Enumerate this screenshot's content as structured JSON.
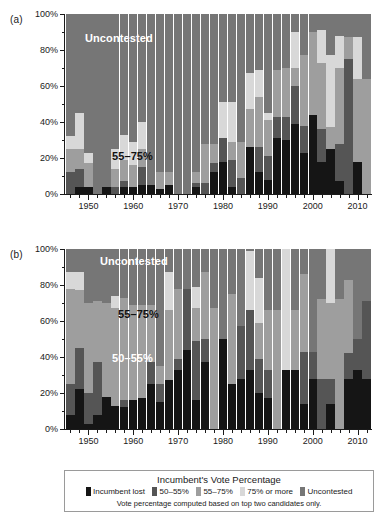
{
  "figure": {
    "panels": [
      {
        "id": "a",
        "label": "(a)"
      },
      {
        "id": "b",
        "label": "(b)"
      }
    ]
  },
  "legend": {
    "title": "Incumbent's Vote Percentage",
    "note": "Vote percentage computed based on top two candidates only.",
    "items": [
      {
        "label": "Incumbent lost",
        "color": "#151515"
      },
      {
        "label": "50–55%",
        "color": "#555555"
      },
      {
        "label": "55–75%",
        "color": "#9e9e9e"
      },
      {
        "label": "75% or more",
        "color": "#d8d8d8"
      },
      {
        "label": "Uncontested",
        "color": "#767676"
      }
    ]
  },
  "annotations": {
    "a": [
      {
        "text": "Uncontested",
        "style": "light",
        "left": 85,
        "top": 32
      },
      {
        "text": "55–75%",
        "style": "dark",
        "left": 112,
        "top": 150
      }
    ],
    "b": [
      {
        "text": "Uncontested",
        "style": "light",
        "left": 100,
        "top": 255
      },
      {
        "text": "55–75%",
        "style": "dark",
        "left": 118,
        "top": 308
      },
      {
        "text": "50–55%",
        "style": "light",
        "left": 112,
        "top": 352
      }
    ]
  },
  "chart_data": [
    {
      "type": "bar",
      "id": "a",
      "title": "",
      "xlabel": "",
      "ylabel": "",
      "ylim": [
        0,
        100
      ],
      "yticks": [
        "0%",
        "20%",
        "40%",
        "60%",
        "80%",
        "100%"
      ],
      "ytick_values": [
        0,
        20,
        40,
        60,
        80,
        100
      ],
      "xticks": [
        "1950",
        "1960",
        "1970",
        "1980",
        "1990",
        "2000",
        "2010"
      ],
      "xtick_values": [
        1950,
        1960,
        1970,
        1980,
        1990,
        2000,
        2010
      ],
      "grid": false,
      "legend_position": "bottom",
      "stacked": true,
      "categories": [
        1946,
        1948,
        1950,
        1952,
        1954,
        1956,
        1958,
        1960,
        1962,
        1964,
        1966,
        1968,
        1970,
        1972,
        1974,
        1976,
        1978,
        1980,
        1982,
        1984,
        1986,
        1988,
        1990,
        1992,
        1994,
        1996,
        1998,
        2000,
        2002,
        2004,
        2006,
        2008,
        2010,
        2012
      ],
      "series": [
        {
          "name": "Incumbent lost",
          "color": "#151515",
          "values": [
            0,
            4,
            4,
            0,
            4,
            0,
            4,
            4,
            5,
            5,
            3,
            5,
            0,
            0,
            4,
            0,
            12,
            18,
            4,
            0,
            26,
            12,
            8,
            31,
            30,
            39,
            23,
            44,
            18,
            25,
            7,
            0,
            18,
            0
          ]
        },
        {
          "name": "50–55%",
          "color": "#555555",
          "values": [
            12,
            10,
            0,
            0,
            0,
            4,
            3,
            0,
            10,
            0,
            0,
            0,
            0,
            0,
            2,
            6,
            5,
            13,
            15,
            9,
            0,
            14,
            13,
            12,
            13,
            21,
            15,
            0,
            18,
            0,
            21,
            75,
            0,
            0
          ]
        },
        {
          "name": "55–75%",
          "color": "#9e9e9e",
          "values": [
            13,
            11,
            13,
            0,
            0,
            10,
            12,
            12,
            10,
            0,
            9,
            7,
            0,
            0,
            6,
            22,
            11,
            0,
            10,
            20,
            21,
            28,
            20,
            26,
            27,
            10,
            39,
            46,
            37,
            12,
            42,
            12,
            46,
            64
          ]
        },
        {
          "name": "75% or more",
          "color": "#d8d8d8",
          "values": [
            7,
            20,
            6,
            0,
            0,
            11,
            14,
            13,
            15,
            0,
            0,
            0,
            0,
            0,
            0,
            0,
            0,
            20,
            22,
            0,
            20,
            15,
            4,
            0,
            0,
            20,
            0,
            0,
            18,
            40,
            18,
            0,
            23,
            0
          ]
        },
        {
          "name": "Uncontested",
          "color": "#767676",
          "values": [
            68,
            55,
            77,
            100,
            96,
            75,
            67,
            71,
            60,
            95,
            88,
            88,
            100,
            100,
            88,
            72,
            72,
            49,
            49,
            71,
            33,
            31,
            55,
            31,
            30,
            10,
            23,
            10,
            9,
            23,
            12,
            13,
            13,
            36
          ]
        }
      ]
    },
    {
      "type": "bar",
      "id": "b",
      "title": "",
      "xlabel": "",
      "ylabel": "",
      "ylim": [
        0,
        100
      ],
      "yticks": [
        "0%",
        "20%",
        "40%",
        "60%",
        "80%",
        "100%"
      ],
      "ytick_values": [
        0,
        20,
        40,
        60,
        80,
        100
      ],
      "xticks": [
        "1950",
        "1960",
        "1970",
        "1980",
        "1990",
        "2000",
        "2010"
      ],
      "xtick_values": [
        1950,
        1960,
        1970,
        1980,
        1990,
        2000,
        2010
      ],
      "grid": false,
      "legend_position": "bottom",
      "stacked": true,
      "categories": [
        1946,
        1948,
        1950,
        1952,
        1954,
        1956,
        1958,
        1960,
        1962,
        1964,
        1966,
        1968,
        1970,
        1972,
        1974,
        1976,
        1978,
        1980,
        1982,
        1984,
        1986,
        1988,
        1990,
        1992,
        1994,
        1996,
        1998,
        2000,
        2002,
        2004,
        2006,
        2008,
        2010,
        2012
      ],
      "series": [
        {
          "name": "Incumbent lost",
          "color": "#151515",
          "values": [
            8,
            22,
            3,
            8,
            18,
            13,
            12,
            16,
            17,
            25,
            15,
            27,
            33,
            44,
            16,
            37,
            0,
            50,
            25,
            28,
            33,
            20,
            17,
            0,
            33,
            33,
            14,
            28,
            0,
            14,
            0,
            28,
            33,
            28
          ]
        },
        {
          "name": "50–55%",
          "color": "#555555",
          "values": [
            17,
            23,
            17,
            29,
            0,
            0,
            4,
            0,
            0,
            12,
            10,
            0,
            6,
            34,
            33,
            13,
            0,
            0,
            0,
            29,
            33,
            19,
            16,
            0,
            0,
            0,
            29,
            15,
            28,
            14,
            0,
            14,
            17,
            43
          ]
        },
        {
          "name": "55–75%",
          "color": "#9e9e9e",
          "values": [
            53,
            32,
            50,
            34,
            52,
            54,
            57,
            53,
            52,
            32,
            10,
            39,
            39,
            0,
            18,
            37,
            67,
            0,
            50,
            0,
            0,
            20,
            33,
            66,
            0,
            33,
            43,
            0,
            44,
            42,
            72,
            41,
            0,
            0
          ]
        },
        {
          "name": "75% or more",
          "color": "#d8d8d8",
          "values": [
            9,
            10,
            0,
            0,
            0,
            7,
            0,
            0,
            0,
            0,
            0,
            21,
            0,
            0,
            12,
            0,
            0,
            0,
            0,
            0,
            33,
            25,
            0,
            0,
            67,
            0,
            0,
            0,
            0,
            30,
            0,
            0,
            0,
            0
          ]
        },
        {
          "name": "Uncontested",
          "color": "#767676",
          "values": [
            13,
            13,
            30,
            29,
            30,
            26,
            27,
            31,
            31,
            31,
            65,
            13,
            22,
            22,
            21,
            13,
            33,
            50,
            25,
            43,
            1,
            16,
            34,
            34,
            0,
            34,
            14,
            57,
            28,
            0,
            28,
            17,
            50,
            29
          ]
        }
      ]
    }
  ]
}
